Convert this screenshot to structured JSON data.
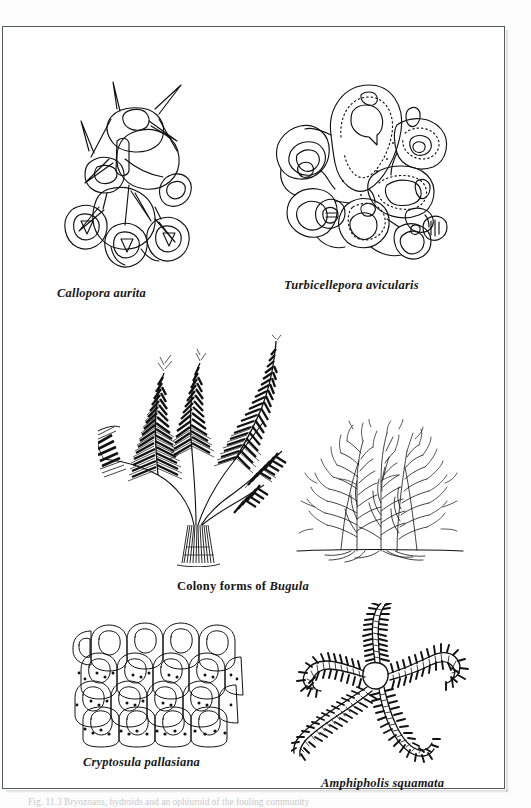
{
  "page": {
    "background_color": "#fdfdfd",
    "plate_background_color": "#ffffff",
    "border_color": "#55585c",
    "ink_color": "#111111",
    "bottom_cutoff_text": "Fig. 11.3  Bryozoans, hydroids and an ophiuroid of the fouling community"
  },
  "figures": [
    {
      "id": "callopora-aurita",
      "caption": "Callopora aurita",
      "caption_style": "bold-italic",
      "art": "line-drawing-bryozoan-zooids-with-spines",
      "position": "top-left"
    },
    {
      "id": "turbicellepora-avicularis",
      "caption": "Turbicellepora avicularis",
      "caption_style": "bold-italic",
      "art": "line-drawing-bryozoan-zooids-with-avicularia",
      "position": "top-right"
    },
    {
      "id": "bugula-colony-forms",
      "caption_parts": [
        {
          "text": "Colony forms of ",
          "style": "bold-upright"
        },
        {
          "text": "Bugula",
          "style": "bold-italic"
        }
      ],
      "caption_plain": "Colony forms of Bugula",
      "art_left": "branching-frond-colony-silhouette",
      "art_right": "dense-bushy-colony",
      "position": "middle-centered"
    },
    {
      "id": "cryptosula-pallasiana",
      "caption": "Cryptosula pallasiana",
      "caption_style": "bold-italic",
      "art": "encrusting-sheet-of-box-shaped-zooids",
      "position": "bottom-left"
    },
    {
      "id": "amphipholis-squamata",
      "caption": "Amphipholis squamata",
      "caption_style": "bold-italic",
      "art": "brittle-star-five-spiny-arms-central-disc",
      "position": "bottom-right"
    }
  ]
}
